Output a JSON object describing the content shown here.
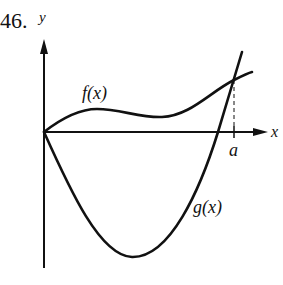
{
  "problem_number": "46.",
  "axes": {
    "x_label": "x",
    "y_label": "y"
  },
  "curves": [
    {
      "name": "f",
      "label": "f(x)"
    },
    {
      "name": "g",
      "label": "g(x)"
    }
  ],
  "marker": {
    "label": "a"
  },
  "colors": {
    "ink": "#111111",
    "background": "#ffffff"
  }
}
